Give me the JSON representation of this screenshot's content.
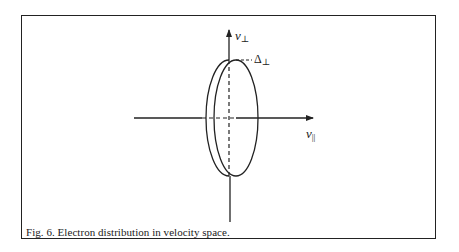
{
  "figure": {
    "caption": "Fig. 6. Electron distribution in velocity space.",
    "axes": {
      "vertical": {
        "symbol": "v",
        "subscript": "⊥",
        "name": "v-perpendicular"
      },
      "horizontal": {
        "symbol": "v",
        "subscript": "||",
        "name": "v-parallel"
      }
    },
    "annotation": {
      "symbol": "Δ",
      "subscript": "⊥",
      "name": "delta-perpendicular"
    },
    "shape": "disk-shaped (flattened) distribution shown as two offset ellipses",
    "colors": {
      "line": "#222222",
      "background": "#ffffff"
    }
  }
}
